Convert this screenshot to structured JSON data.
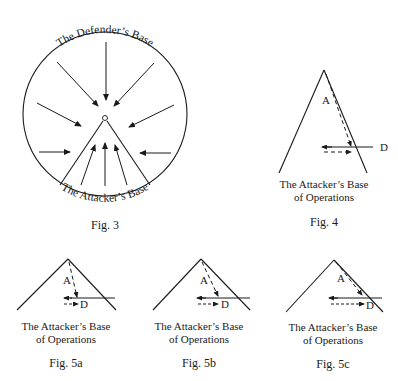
{
  "fig3": {
    "top_label": "The Defender’s Base",
    "bottom_label": "The Attacker’s Base",
    "caption": "Fig. 3"
  },
  "fig4": {
    "label_A": "A",
    "label_D": "D",
    "base_line1": "The Attacker’s Base",
    "base_line2": "of Operations",
    "caption": "Fig. 4"
  },
  "fig5a": {
    "label_A": "A",
    "label_D": "D",
    "base_line1": "The Attacker’s Base",
    "base_line2": "of Operations",
    "caption": "Fig. 5a"
  },
  "fig5b": {
    "label_A": "A",
    "label_D": "D",
    "base_line1": "The Attacker’s Base",
    "base_line2": "of Operations",
    "caption": "Fig. 5b"
  },
  "fig5c": {
    "label_A": "A",
    "label_D": "D",
    "base_line1": "The Attacker’s Base",
    "base_line2": "of Operations",
    "caption": "Fig. 5c"
  },
  "colors": {
    "ink": "#1a1a1a",
    "background": "#ffffff"
  }
}
